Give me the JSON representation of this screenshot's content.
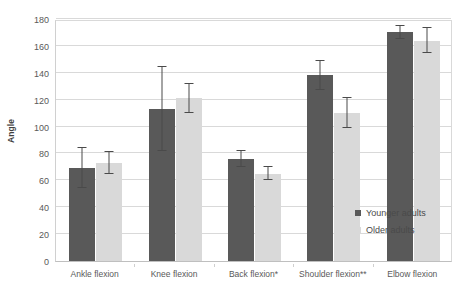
{
  "chart_data": {
    "type": "bar",
    "title": "",
    "subtitle": "",
    "xlabel": "",
    "ylabel": "Angle",
    "ylim": [
      0,
      180
    ],
    "ytick_step": 20,
    "yticks": [
      0,
      20,
      40,
      60,
      80,
      100,
      120,
      140,
      160,
      180
    ],
    "ytick_labels": [
      "0",
      "20",
      "40",
      "60",
      "80",
      "100",
      "120",
      "140",
      "160",
      "180"
    ],
    "grid": true,
    "grid_axis": "y",
    "legend_position": "inside-bottom-right",
    "categories": [
      "Ankle flexion",
      "Knee flexion",
      "Back flexion*",
      "Shoulder flexion**",
      "Elbow flexion"
    ],
    "series": [
      {
        "name": "Younger adults",
        "color": "#595959",
        "values": [
          69,
          113,
          76,
          138,
          170
        ],
        "errors": [
          15,
          31,
          6,
          11,
          5
        ],
        "error_low": [
          54,
          82,
          70,
          127,
          165
        ],
        "error_high": [
          84,
          144,
          82,
          149,
          175
        ]
      },
      {
        "name": "Older adults",
        "color": "#d9d9d9",
        "values": [
          73,
          121,
          65,
          110,
          164
        ],
        "errors": [
          8,
          11,
          5,
          11,
          9
        ],
        "error_low": [
          65,
          110,
          60,
          99,
          155
        ],
        "error_high": [
          81,
          132,
          70,
          121,
          173
        ]
      }
    ],
    "annotations": [
      "* indicates significance for Back flexion",
      "** indicates significance for Shoulder flexion"
    ]
  },
  "legend": {
    "items": [
      {
        "label": "Younger adults",
        "color": "#595959"
      },
      {
        "label": "Older adults",
        "color": "#d9d9d9"
      }
    ]
  },
  "colors": {
    "younger": "#595959",
    "older": "#d9d9d9",
    "gridline": "#d9d9d9",
    "axis": "#bfbfbf",
    "text": "#595959",
    "error_bar": "#4a4a4a",
    "background": "#ffffff"
  }
}
